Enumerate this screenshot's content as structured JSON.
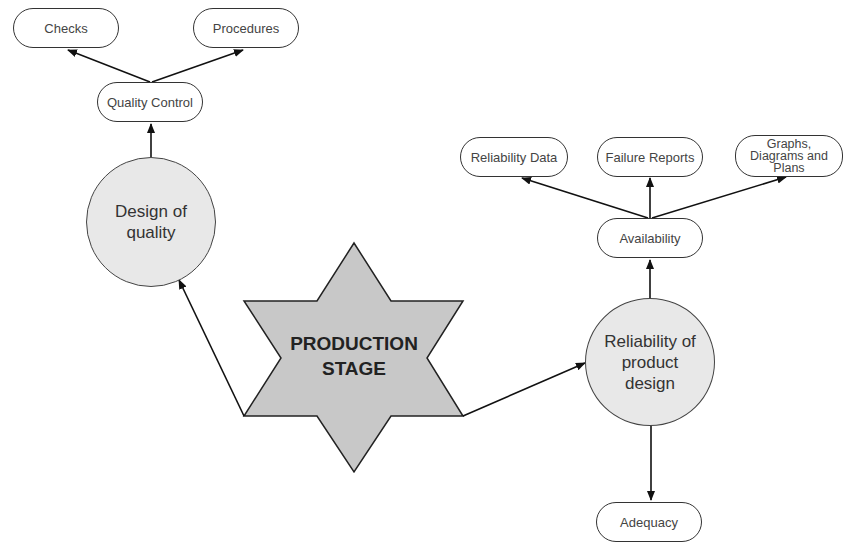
{
  "diagram": {
    "center": {
      "label_line1": "PRODUCTION",
      "label_line2": "STAGE",
      "shape": "six-point-star",
      "fill": "#c8c8c8"
    },
    "left_branch": {
      "circle": {
        "label_line1": "Design of",
        "label_line2": "quality",
        "fill": "#e8e8e8"
      },
      "child": {
        "label": "Quality Control"
      },
      "grandchildren": [
        {
          "label": "Checks"
        },
        {
          "label": "Procedures"
        }
      ]
    },
    "right_branch": {
      "circle": {
        "label_line1": "Reliability of",
        "label_line2": "product",
        "label_line3": "design",
        "fill": "#e8e8e8"
      },
      "up_child": {
        "label": "Availability"
      },
      "up_grandchildren": [
        {
          "label": "Reliability Data"
        },
        {
          "label": "Failure Reports"
        },
        {
          "label_line1": "Graphs,",
          "label_line2": "Diagrams and",
          "label_line3": "Plans"
        }
      ],
      "down_child": {
        "label": "Adequacy"
      }
    }
  }
}
